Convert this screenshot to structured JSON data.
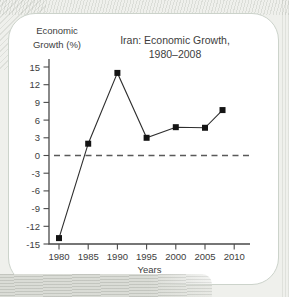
{
  "page": {
    "background_color": "#eff0ec",
    "card_background": "#ffffff",
    "card_border_color": "#ccd3cb"
  },
  "chart": {
    "title_lines": [
      "Iran: Economic Growth,",
      "1980–2008"
    ],
    "y_axis_title_lines": [
      "Economic",
      "Growth (%)"
    ],
    "x_axis_title": "Years",
    "axis_color": "#4a4a4a",
    "text_color": "#3d3d3d",
    "line_color": "#2e2e2e",
    "marker_color": "#141414",
    "zero_line_color": "#5a5a5a"
  },
  "chart_data": {
    "type": "line",
    "title": "Iran: Economic Growth, 1980–2008",
    "xlabel": "Years",
    "ylabel": "Economic Growth (%)",
    "x": [
      1980,
      1985,
      1990,
      1995,
      2000,
      2005,
      2008
    ],
    "y": [
      -14,
      2,
      14,
      3,
      4.8,
      4.7,
      7.7
    ],
    "x_ticks": [
      1980,
      1985,
      1990,
      1995,
      2000,
      2005,
      2010
    ],
    "y_ticks": [
      15,
      12,
      9,
      6,
      3,
      0,
      -3,
      -6,
      -9,
      -12,
      -15
    ],
    "xlim": [
      1978.5,
      2012.5
    ],
    "ylim": [
      -15,
      15
    ],
    "zero_reference_line": "dashed",
    "marker": "square",
    "grid": false,
    "legend_position": "none"
  }
}
